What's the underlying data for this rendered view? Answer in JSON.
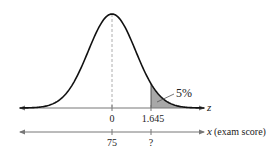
{
  "figure": {
    "annotation": "5%",
    "z_axis": {
      "name": "z",
      "ticks": [
        {
          "value": 0,
          "label": "0"
        },
        {
          "value": 1.645,
          "label": "1.645"
        }
      ]
    },
    "x_axis": {
      "name": "x",
      "description": "(exam score)",
      "ticks": [
        {
          "label": "75"
        },
        {
          "label": "?"
        }
      ]
    },
    "colors": {
      "curve": "#111111",
      "axis": "#777777",
      "shade": "#a8a8a8",
      "dashed": "#999999"
    }
  },
  "chart_data": {
    "type": "area",
    "title": "",
    "distribution": "normal",
    "mean_z": 0,
    "mean_x": 75,
    "critical_z": 1.645,
    "critical_x": "?",
    "shaded_region": {
      "from_z": 1.645,
      "to_z": "inf",
      "area_label": "5%"
    },
    "xlabel": "x (exam score)",
    "zlabel": "z",
    "axes": [
      {
        "name": "z",
        "tick_labels": [
          "0",
          "1.645"
        ]
      },
      {
        "name": "x (exam score)",
        "tick_labels": [
          "75",
          "?"
        ]
      }
    ],
    "grid": false,
    "legend": null
  }
}
